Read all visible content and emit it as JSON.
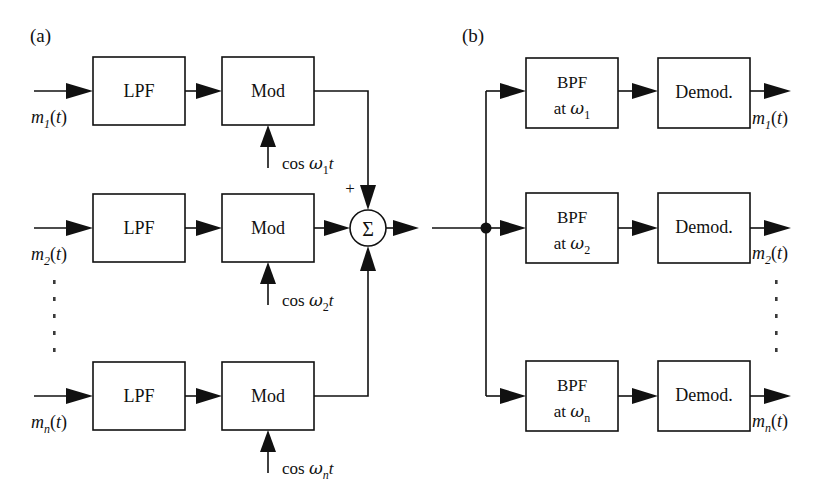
{
  "figure": {
    "panels": [
      {
        "id": "a",
        "label": "(a)",
        "role": "transmitter-multiplexer",
        "rows": [
          {
            "input_label_base": "m",
            "input_label_sub": "1",
            "input_label_tail": "(t)",
            "filter_label": "LPF",
            "modulator_label": "Mod",
            "carrier_prefix": "cos ",
            "carrier_omega": "ω",
            "carrier_sub": "1",
            "carrier_tail": "t"
          },
          {
            "input_label_base": "m",
            "input_label_sub": "2",
            "input_label_tail": "(t)",
            "filter_label": "LPF",
            "modulator_label": "Mod",
            "carrier_prefix": "cos ",
            "carrier_omega": "ω",
            "carrier_sub": "2",
            "carrier_tail": "t"
          },
          {
            "input_label_base": "m",
            "input_label_sub": "n",
            "input_label_tail": "(t)",
            "filter_label": "LPF",
            "modulator_label": "Mod",
            "carrier_prefix": "cos ",
            "carrier_omega": "ω",
            "carrier_sub": "n",
            "carrier_tail": "t"
          }
        ],
        "summer": {
          "glyph": "Σ",
          "plus_sign": "+"
        },
        "vertical_ellipsis": "⋮"
      },
      {
        "id": "b",
        "label": "(b)",
        "role": "receiver-demultiplexer",
        "rows": [
          {
            "bandpass_label": "BPF",
            "bandpass_label_line2_prefix": "at ",
            "bandpass_omega": "ω",
            "bandpass_sub": "1",
            "demod_label": "Demod.",
            "output_label_base": "m",
            "output_label_sub": "1",
            "output_label_tail": "(t)"
          },
          {
            "bandpass_label": "BPF",
            "bandpass_label_line2_prefix": "at ",
            "bandpass_omega": "ω",
            "bandpass_sub": "2",
            "demod_label": "Demod.",
            "output_label_base": "m",
            "output_label_sub": "2",
            "output_label_tail": "(t)"
          },
          {
            "bandpass_label": "BPF",
            "bandpass_label_line2_prefix": "at ",
            "bandpass_omega": "ω",
            "bandpass_sub": "n",
            "demod_label": "Demod.",
            "output_label_base": "m",
            "output_label_sub": "n",
            "output_label_tail": "(t)"
          }
        ],
        "vertical_ellipsis": "⋮"
      }
    ],
    "colors": {
      "line": "#111111",
      "background": "#ffffff",
      "dots": "#3a3a3a"
    }
  }
}
